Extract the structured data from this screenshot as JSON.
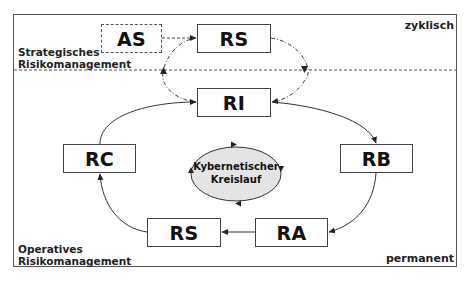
{
  "corner_labels": {
    "top_right": "zyklisch",
    "bottom_right": "permanent",
    "strategic": [
      "Strategisches",
      "Risikomanagement"
    ],
    "operative": [
      "Operatives",
      "Risikomanagement"
    ]
  },
  "nodes": {
    "as": "AS",
    "rs_top": "RS",
    "ri": "RI",
    "rc": "RC",
    "rb": "RB",
    "rs_bottom": "RS",
    "ra": "RA"
  },
  "center": {
    "line1": "Kybernetischer",
    "line2": "Kreislauf"
  },
  "colors": {
    "ellipse_fill": "#e4e4e4",
    "stroke": "#333333",
    "frame": "#555555"
  }
}
